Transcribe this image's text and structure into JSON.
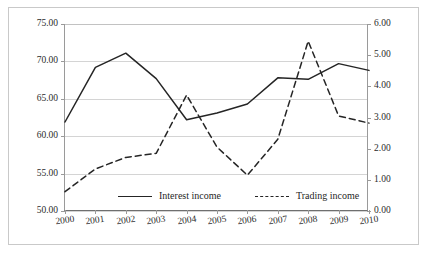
{
  "figure": {
    "frame_color": "#c9c9c9",
    "background": "#ffffff",
    "line_color": "#252525",
    "grid_color": "#d4d4d4"
  },
  "chart_data": {
    "type": "line",
    "title": "",
    "xlabel": "",
    "ylabel": "",
    "grid": "horizontal",
    "legend_position": "bottom-center",
    "categories": [
      "2000",
      "2001",
      "2002",
      "2003",
      "2004",
      "2005",
      "2006",
      "2007",
      "2008",
      "2009",
      "2010"
    ],
    "x": [
      2000,
      2001,
      2002,
      2003,
      2004,
      2005,
      2006,
      2007,
      2008,
      2009,
      2010
    ],
    "axes": {
      "left": {
        "label": "",
        "ylim": [
          50.0,
          75.0
        ],
        "ticks": [
          50.0,
          55.0,
          60.0,
          65.0,
          70.0,
          75.0
        ],
        "tick_labels": [
          "50.00",
          "55.00",
          "60.00",
          "65.00",
          "70.00",
          "75.00"
        ]
      },
      "right": {
        "label": "",
        "ylim": [
          0.0,
          6.0
        ],
        "ticks": [
          0.0,
          1.0,
          2.0,
          3.0,
          4.0,
          5.0,
          6.0
        ],
        "tick_labels": [
          "0.00",
          "1.00",
          "2.00",
          "3.00",
          "4.00",
          "5.00",
          "6.00"
        ]
      }
    },
    "series": [
      {
        "name": "Interest income",
        "axis": "left",
        "style": "solid",
        "color": "#252525",
        "values": [
          61.9,
          69.2,
          71.1,
          67.7,
          62.2,
          63.1,
          64.3,
          67.8,
          67.6,
          69.7,
          68.8
        ]
      },
      {
        "name": "Trading income",
        "axis": "right",
        "style": "dashed",
        "color": "#252525",
        "values": [
          0.62,
          1.35,
          1.72,
          1.85,
          3.72,
          2.05,
          1.15,
          2.3,
          5.45,
          3.05,
          2.82
        ]
      }
    ]
  },
  "legend": {
    "entries": [
      {
        "label": "Interest income",
        "style": "solid"
      },
      {
        "label": "Trading income",
        "style": "dashed"
      }
    ]
  }
}
